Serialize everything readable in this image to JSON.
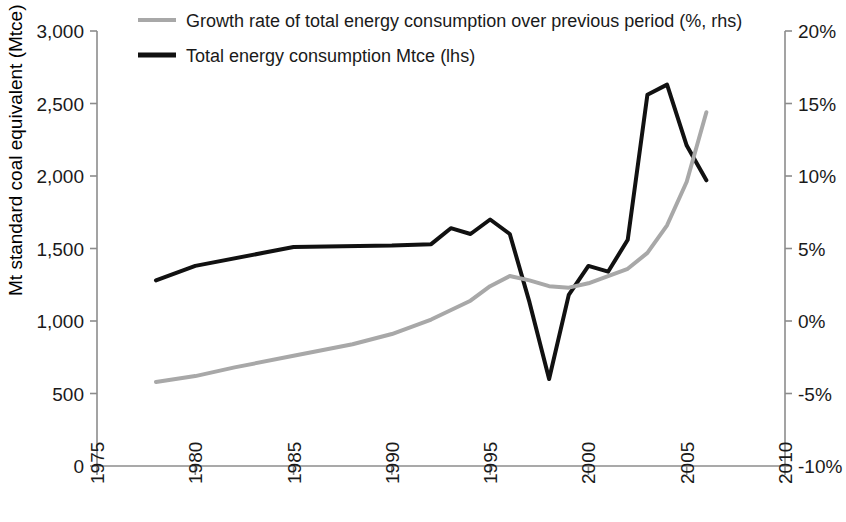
{
  "chart_data": {
    "type": "line",
    "title": "",
    "xlabel": "",
    "ylabel": "Mt standard coal equivalent (Mtce)",
    "y2label": "",
    "xlim": [
      1975,
      2010
    ],
    "ylim": [
      0,
      3000
    ],
    "y2lim": [
      -10,
      20
    ],
    "grid": false,
    "legend_position": "top",
    "x_ticks": [
      "1975",
      "1980",
      "1985",
      "1990",
      "1995",
      "2000",
      "2005",
      "2010"
    ],
    "x_tick_values": [
      1975,
      1980,
      1985,
      1990,
      1995,
      2000,
      2005,
      2010
    ],
    "y_ticks": [
      "0",
      "500",
      "1,000",
      "1,500",
      "2,000",
      "2,500",
      "3,000"
    ],
    "y_tick_values": [
      0,
      500,
      1000,
      1500,
      2000,
      2500,
      3000
    ],
    "y2_ticks": [
      "-10%",
      "-5%",
      "0%",
      "5%",
      "10%",
      "15%",
      "20%"
    ],
    "y2_tick_values": [
      -10,
      -5,
      0,
      5,
      10,
      15,
      20
    ],
    "series": [
      {
        "name": "Total energy consumption Mtce (lhs)",
        "axis": "left",
        "color": "#111111",
        "width": 4,
        "x": [
          1978,
          1980,
          1985,
          1990,
          1992,
          1993,
          1994,
          1995,
          1996,
          1997,
          1998,
          1999,
          2000,
          2001,
          2002,
          2003,
          2004,
          2005,
          2006
        ],
        "values": [
          1280,
          1380,
          1510,
          1520,
          1530,
          1640,
          1600,
          1700,
          1600,
          1130,
          600,
          1180,
          1380,
          1340,
          1560,
          2560,
          2630,
          2210,
          1970
        ]
      },
      {
        "name": "Growth rate of total energy consumption over previous period (%, rhs)",
        "axis": "right",
        "color": "#a8a8a8",
        "width": 4,
        "x": [
          1978,
          1980,
          1982,
          1985,
          1988,
          1990,
          1992,
          1994,
          1995,
          1996,
          1997,
          1998,
          1999,
          2000,
          2001,
          2002,
          2003,
          2004,
          2005,
          2006
        ],
        "values": [
          -4.2,
          -3.8,
          -3.2,
          -2.4,
          -1.6,
          -0.9,
          0.1,
          1.4,
          2.4,
          3.1,
          2.8,
          2.4,
          2.3,
          2.6,
          3.1,
          3.6,
          4.7,
          6.6,
          9.6,
          14.4
        ]
      }
    ]
  },
  "legend": {
    "items": [
      {
        "label": "Growth rate of total energy consumption over previous period (%, rhs)",
        "color": "#a8a8a8"
      },
      {
        "label": "Total energy consumption Mtce (lhs)",
        "color": "#111111"
      }
    ]
  },
  "axes": {
    "y_left_title": "Mt standard coal equivalent (Mtce)"
  }
}
